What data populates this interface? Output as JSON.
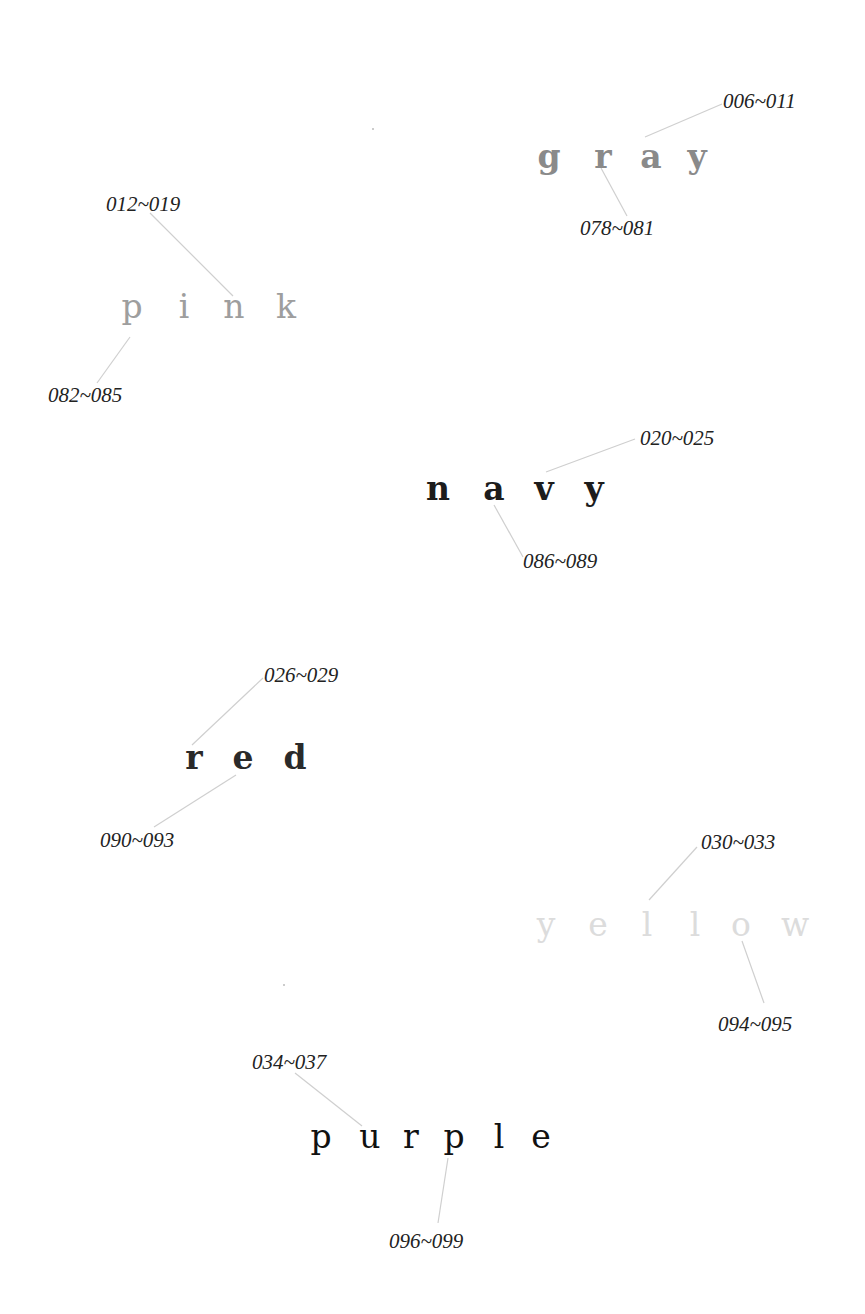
{
  "words": [
    {
      "name": "gray",
      "text": "gray",
      "color": "#8a8a8a",
      "weight": "bold",
      "letters": [
        {
          "ch": "g",
          "x": 549,
          "y": 165
        },
        {
          "ch": "r",
          "x": 603,
          "y": 165
        },
        {
          "ch": "a",
          "x": 651,
          "y": 165
        },
        {
          "ch": "y",
          "x": 697,
          "y": 165
        }
      ],
      "labels": [
        {
          "text": "006~011",
          "x": 723,
          "y": 108,
          "line": [
            722,
            104,
            645,
            137
          ]
        },
        {
          "text": "078~081",
          "x": 580,
          "y": 235,
          "line": [
            601,
            168,
            627,
            216
          ]
        }
      ]
    },
    {
      "name": "pink",
      "text": "pink",
      "color": "#9e9e9e",
      "weight": "normal",
      "letters": [
        {
          "ch": "p",
          "x": 132,
          "y": 315
        },
        {
          "ch": "i",
          "x": 184,
          "y": 315
        },
        {
          "ch": "n",
          "x": 234,
          "y": 315
        },
        {
          "ch": "k",
          "x": 286,
          "y": 315
        }
      ],
      "labels": [
        {
          "text": "012~019",
          "x": 106,
          "y": 211,
          "line": [
            150,
            213,
            233,
            296
          ]
        },
        {
          "text": "082~085",
          "x": 48,
          "y": 402,
          "line": [
            130,
            337,
            97,
            383
          ]
        }
      ]
    },
    {
      "name": "navy",
      "text": "navy",
      "color": "#1c1c1c",
      "weight": "bold",
      "letters": [
        {
          "ch": "n",
          "x": 438,
          "y": 497
        },
        {
          "ch": "a",
          "x": 494,
          "y": 497
        },
        {
          "ch": "v",
          "x": 544,
          "y": 497
        },
        {
          "ch": "y",
          "x": 594,
          "y": 497
        }
      ],
      "labels": [
        {
          "text": "020~025",
          "x": 640,
          "y": 445,
          "line": [
            635,
            439,
            546,
            472
          ]
        },
        {
          "text": "086~089",
          "x": 523,
          "y": 568,
          "line": [
            494,
            505,
            523,
            557
          ]
        }
      ]
    },
    {
      "name": "red",
      "text": "red",
      "color": "#2a2a2a",
      "weight": "bold",
      "letters": [
        {
          "ch": "r",
          "x": 194,
          "y": 766
        },
        {
          "ch": "e",
          "x": 243,
          "y": 766
        },
        {
          "ch": "d",
          "x": 295,
          "y": 766
        }
      ],
      "labels": [
        {
          "text": "026~029",
          "x": 264,
          "y": 682,
          "line": [
            263,
            678,
            192,
            745
          ]
        },
        {
          "text": "090~093",
          "x": 100,
          "y": 847,
          "line": [
            236,
            775,
            154,
            827
          ]
        }
      ]
    },
    {
      "name": "yellow",
      "text": "yellow",
      "color": "#dcdcdc",
      "weight": "normal",
      "letters": [
        {
          "ch": "y",
          "x": 546,
          "y": 933
        },
        {
          "ch": "e",
          "x": 598,
          "y": 933
        },
        {
          "ch": "l",
          "x": 647,
          "y": 933
        },
        {
          "ch": "l",
          "x": 695,
          "y": 933
        },
        {
          "ch": "o",
          "x": 741,
          "y": 933
        },
        {
          "ch": "w",
          "x": 795,
          "y": 933
        }
      ],
      "labels": [
        {
          "text": "030~033",
          "x": 701,
          "y": 849,
          "line": [
            697,
            847,
            649,
            900
          ]
        },
        {
          "text": "094~095",
          "x": 718,
          "y": 1031,
          "line": [
            742,
            941,
            764,
            1003
          ]
        }
      ]
    },
    {
      "name": "purple",
      "text": "purple",
      "color": "#111111",
      "weight": "normal",
      "letters": [
        {
          "ch": "p",
          "x": 321,
          "y": 1145
        },
        {
          "ch": "u",
          "x": 370,
          "y": 1145
        },
        {
          "ch": "r",
          "x": 411,
          "y": 1145
        },
        {
          "ch": "p",
          "x": 454,
          "y": 1145
        },
        {
          "ch": "l",
          "x": 499,
          "y": 1145
        },
        {
          "ch": "e",
          "x": 541,
          "y": 1145
        }
      ],
      "labels": [
        {
          "text": "034~037",
          "x": 252,
          "y": 1069,
          "line": [
            295,
            1073,
            362,
            1126
          ]
        },
        {
          "text": "096~099",
          "x": 389,
          "y": 1248,
          "line": [
            448,
            1158,
            438,
            1223
          ]
        }
      ]
    }
  ],
  "style": {
    "leader_color": "#cfcfcf",
    "label_color": "#222222"
  }
}
